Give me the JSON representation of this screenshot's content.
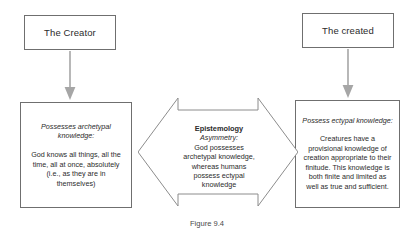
{
  "figure": {
    "caption": "Figure 9.4",
    "colors": {
      "box_border": "#6f6f6f",
      "arrow_fill": "#a6a6a6",
      "arrow_outline": "#8c8c8c",
      "background": "#ffffff",
      "text": "#2b2b2b"
    }
  },
  "nodes": {
    "creator": {
      "label": "The Creator"
    },
    "created": {
      "label": "The created"
    },
    "archetypal": {
      "heading": "Possesses archetypal knowledge:",
      "body": "God knows all things, all the time, all at once, absolutely (i.e., as they are in themselves)"
    },
    "ectypal": {
      "heading": "Possess ectypal knowledge:",
      "body": "Creatures have a provisional knowledge of creation appropriate to their finitude. This knowledge is both finite and limited as well as true and sufficient."
    }
  },
  "center_arrow": {
    "title": "Epistemology",
    "subtitle": "Asymmetry:",
    "body": "God possesses archetypal knowledge, whereas humans possess ectypal knowledge",
    "direction": "bidirectional-horizontal"
  },
  "connectors": {
    "creator_to_archetypal": {
      "icon": "arrow-down-icon"
    },
    "created_to_ectypal": {
      "icon": "arrow-down-icon"
    }
  }
}
